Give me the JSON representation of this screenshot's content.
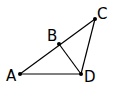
{
  "diagram": {
    "type": "geometry",
    "points": [
      {
        "id": "A",
        "label": "A",
        "x": 20,
        "y": 74,
        "lx": 6,
        "ly": 81
      },
      {
        "id": "B",
        "label": "B",
        "x": 59,
        "y": 44,
        "lx": 47,
        "ly": 41
      },
      {
        "id": "C",
        "label": "C",
        "x": 95,
        "y": 19,
        "lx": 97,
        "ly": 19
      },
      {
        "id": "D",
        "label": "D",
        "x": 81,
        "y": 74,
        "lx": 84,
        "ly": 82
      }
    ],
    "segments": [
      [
        "A",
        "C"
      ],
      [
        "A",
        "D"
      ],
      [
        "C",
        "D"
      ],
      [
        "B",
        "D"
      ]
    ],
    "colors": {
      "stroke": "#000000",
      "background": "#ffffff"
    }
  }
}
